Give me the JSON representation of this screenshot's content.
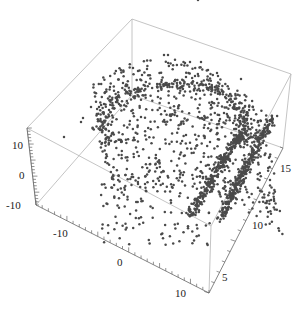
{
  "chart_data": {
    "type": "scatter3d",
    "title": "",
    "xlabel": "",
    "ylabel": "",
    "zlabel": "",
    "x_axis": {
      "ticks": [
        -10,
        0,
        10
      ],
      "range": [
        -15,
        13
      ]
    },
    "y_axis": {
      "ticks": [
        5,
        10,
        15
      ],
      "range": [
        3,
        17
      ]
    },
    "z_axis": {
      "ticks": [
        -10,
        0,
        10
      ],
      "range": [
        -11,
        13
      ]
    },
    "grid": false,
    "legend": null,
    "point_color": "#4a4a4a",
    "box_color": "#b0b0b0",
    "approx_point_count": 1500
  },
  "axes_labels": {
    "z_ticks": [
      "10",
      "0",
      "-10"
    ],
    "x_ticks": [
      "-10",
      "0",
      "10"
    ],
    "y_ticks": [
      "5",
      "10",
      "15"
    ]
  }
}
